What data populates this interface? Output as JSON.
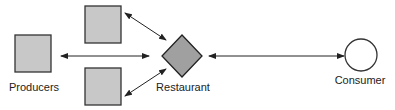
{
  "diagram": {
    "nodes": [
      {
        "id": "producer-main",
        "shape": "square",
        "label": "Producers"
      },
      {
        "id": "producer-top",
        "shape": "square",
        "label": ""
      },
      {
        "id": "producer-bottom",
        "shape": "square",
        "label": ""
      },
      {
        "id": "restaurant",
        "shape": "diamond",
        "label": "Restaurant"
      },
      {
        "id": "consumer",
        "shape": "circle",
        "label": "Consumer"
      }
    ],
    "edges": [
      {
        "from": "producer-main",
        "to": "restaurant",
        "direction": "both"
      },
      {
        "from": "producer-top",
        "to": "restaurant",
        "direction": "both"
      },
      {
        "from": "producer-bottom",
        "to": "restaurant",
        "direction": "both"
      },
      {
        "from": "restaurant",
        "to": "consumer",
        "direction": "both"
      }
    ],
    "colors": {
      "square_fill": "#c8c8c8",
      "diamond_fill": "#a0a0a0",
      "stroke": "#333333",
      "circle_fill": "#ffffff"
    }
  }
}
